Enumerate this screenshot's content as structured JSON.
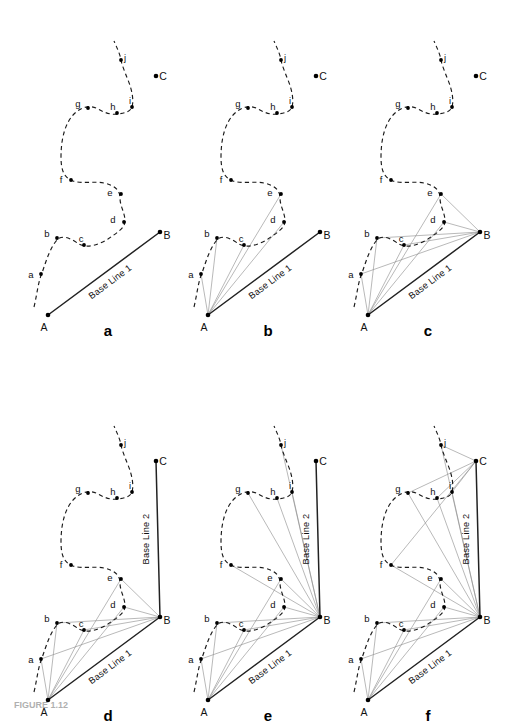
{
  "figure": {
    "caption_fragment": "FIGURE 1.12",
    "background_color": "#ffffff",
    "ink_color": "#111111",
    "ray_color": "#8d8d8d",
    "baseline_color": "#222222",
    "curve_style": "dashed"
  },
  "labels": {
    "baseline_1": "Base Line 1",
    "baseline_2": "Base Line 2",
    "node_a": "A",
    "node_b": "B",
    "node_c": "C",
    "station_a": "a",
    "station_b": "b",
    "station_c": "c",
    "station_d": "d",
    "station_e": "e",
    "station_f": "f",
    "station_g": "g",
    "station_h": "h",
    "station_i": "i",
    "station_j": "j"
  },
  "panels": [
    {
      "id": "a",
      "letter": "a",
      "row": 0,
      "col": 0,
      "origin": [
        8,
        10
      ],
      "letter_pos": [
        100,
        322
      ],
      "baselines": [
        "baseline_1"
      ],
      "rays_from": [],
      "description": "Traverse curve with base line 1 only"
    },
    {
      "id": "b",
      "letter": "b",
      "row": 0,
      "col": 1,
      "origin": [
        168,
        10
      ],
      "letter_pos": [
        100,
        322
      ],
      "baselines": [
        "baseline_1"
      ],
      "rays_from": [
        {
          "node": "A",
          "targets": [
            "a",
            "b",
            "c",
            "d",
            "e"
          ]
        }
      ],
      "description": "Rays from station A to a-e"
    },
    {
      "id": "c",
      "letter": "c",
      "row": 0,
      "col": 2,
      "origin": [
        328,
        10
      ],
      "letter_pos": [
        100,
        322
      ],
      "baselines": [
        "baseline_1"
      ],
      "rays_from": [
        {
          "node": "A",
          "targets": [
            "a",
            "b",
            "c",
            "d",
            "e"
          ]
        },
        {
          "node": "B",
          "targets": [
            "a",
            "b",
            "c",
            "d",
            "e"
          ]
        }
      ],
      "description": "Rays from A and B to a-e"
    },
    {
      "id": "d",
      "letter": "d",
      "row": 1,
      "col": 0,
      "origin": [
        8,
        395
      ],
      "letter_pos": [
        100,
        322
      ],
      "baselines": [
        "baseline_1",
        "baseline_2"
      ],
      "rays_from": [
        {
          "node": "A",
          "targets": [
            "a",
            "b",
            "c",
            "d",
            "e"
          ]
        },
        {
          "node": "B",
          "targets": [
            "a",
            "b",
            "c",
            "d",
            "e"
          ]
        }
      ],
      "description": "Base line 2 added from B to C"
    },
    {
      "id": "e",
      "letter": "e",
      "row": 1,
      "col": 1,
      "origin": [
        168,
        395
      ],
      "letter_pos": [
        100,
        322
      ],
      "baselines": [
        "baseline_1",
        "baseline_2"
      ],
      "rays_from": [
        {
          "node": "A",
          "targets": [
            "a",
            "b",
            "c",
            "d",
            "e"
          ]
        },
        {
          "node": "B",
          "targets": [
            "a",
            "b",
            "c",
            "d",
            "e",
            "f",
            "g",
            "h",
            "i",
            "j"
          ]
        }
      ],
      "description": "Rays from B extended to f-j"
    },
    {
      "id": "f",
      "letter": "f",
      "row": 1,
      "col": 2,
      "origin": [
        328,
        395
      ],
      "letter_pos": [
        100,
        322
      ],
      "baselines": [
        "baseline_1",
        "baseline_2"
      ],
      "rays_from": [
        {
          "node": "A",
          "targets": [
            "a",
            "b",
            "c",
            "d",
            "e"
          ]
        },
        {
          "node": "B",
          "targets": [
            "a",
            "b",
            "c",
            "d",
            "e",
            "f",
            "g",
            "h",
            "i",
            "j"
          ]
        },
        {
          "node": "C",
          "targets": [
            "f",
            "g",
            "h",
            "i",
            "j"
          ]
        }
      ],
      "description": "Complete network with rays from A, B and C"
    }
  ],
  "geometry": {
    "panel_size": [
      168,
      345
    ],
    "nodes": {
      "A": {
        "x": 40,
        "y": 305,
        "label_dx": -4,
        "label_dy": 13
      },
      "B": {
        "x": 152,
        "y": 222,
        "label_dx": 7,
        "label_dy": 4
      },
      "C": {
        "x": 148,
        "y": 66,
        "label_dx": 7,
        "label_dy": 1
      }
    },
    "stations": {
      "a": {
        "x": 33,
        "y": 264,
        "label_dx": -10,
        "label_dy": 1
      },
      "b": {
        "x": 49,
        "y": 228,
        "label_dx": -10,
        "label_dy": -4
      },
      "c": {
        "x": 76,
        "y": 235,
        "label_dx": -3,
        "label_dy": -6
      },
      "d": {
        "x": 116,
        "y": 212,
        "label_dx": -11,
        "label_dy": -2
      },
      "e": {
        "x": 113,
        "y": 184,
        "label_dx": -11,
        "label_dy": -1
      },
      "f": {
        "x": 63,
        "y": 170,
        "label_dx": -10,
        "label_dy": 0
      },
      "g": {
        "x": 80,
        "y": 98,
        "label_dx": -10,
        "label_dy": -4
      },
      "h": {
        "x": 109,
        "y": 103,
        "label_dx": -4,
        "label_dy": -6
      },
      "i": {
        "x": 124,
        "y": 97,
        "label_dx": -2,
        "label_dy": -6
      },
      "j": {
        "x": 113,
        "y": 50,
        "label_dx": 4,
        "label_dy": -2
      }
    },
    "curve_path": "M 26,297 C 29,285 30,272 34,263 C 39,248 43,236 50,229 C 57,224 66,231 71,234 C 80,239 92,234 100,229 C 110,222 117,218 117,211 C 117,203 112,196 112,188 C 112,180 106,175 96,173 C 86,171 74,174 65,171 C 56,168 53,160 53,147 C 53,129 57,113 66,104 C 74,96 83,95 90,99 C 97,103 103,105 110,104 C 117,103 122,102 124,97 C 126,90 124,80 120,70 C 116,60 114,55 113,50 C 112,44 109,38 106,31",
    "baseline_1": {
      "from": "A",
      "to": "B"
    },
    "baseline_2": {
      "from": "B",
      "to": "C"
    }
  }
}
